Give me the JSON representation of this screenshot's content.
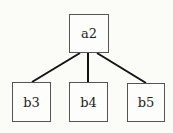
{
  "diagram": {
    "type": "tree",
    "nodes": [
      {
        "id": "a2",
        "label": "a2",
        "x": 69,
        "y": 14,
        "w": 40,
        "h": 39
      },
      {
        "id": "b3",
        "label": "b3",
        "x": 12,
        "y": 82,
        "w": 39,
        "h": 40
      },
      {
        "id": "b4",
        "label": "b4",
        "x": 69,
        "y": 82,
        "w": 39,
        "h": 40
      },
      {
        "id": "b5",
        "label": "b5",
        "x": 127,
        "y": 83,
        "w": 38,
        "h": 39
      }
    ],
    "edges": [
      {
        "from": "a2",
        "to": "b3"
      },
      {
        "from": "a2",
        "to": "b4"
      },
      {
        "from": "a2",
        "to": "b5"
      }
    ],
    "colors": {
      "line": "#111111",
      "border": "#555555",
      "background": "#fbfbf8"
    }
  }
}
